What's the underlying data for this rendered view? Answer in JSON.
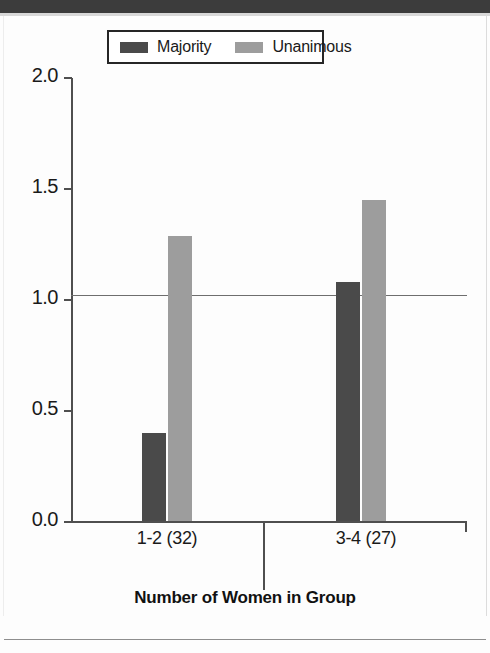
{
  "chart_data": {
    "type": "bar",
    "title": "",
    "xlabel": "Number of Women in Group",
    "ylabel": "",
    "categories": [
      "1-2 (32)",
      "3-4 (27)"
    ],
    "series": [
      {
        "name": "Majority",
        "values": [
          0.4,
          1.08
        ],
        "color": "#4a4a4a"
      },
      {
        "name": "Unanimous",
        "values": [
          1.29,
          1.45
        ],
        "color": "#9d9d9d"
      }
    ],
    "ylim": [
      0.0,
      2.0
    ],
    "yticks": [
      "0.0",
      "0.5",
      "1.0",
      "1.5",
      "2.0"
    ],
    "ytick_values": [
      0.0,
      0.5,
      1.0,
      1.5,
      2.0
    ],
    "grid": "single horizontal reference line at y = 1.0",
    "gridline_value": 1.0,
    "legend_position": "top-center",
    "legend_entries": [
      "Majority",
      "Unanimous"
    ]
  },
  "legend": {
    "entries": [
      {
        "label": "Majority",
        "swatch": "legend-swatch-majority",
        "color": "#4a4a4a"
      },
      {
        "label": "Unanimous",
        "swatch": "legend-swatch-unanimous",
        "color": "#9d9d9d"
      }
    ]
  },
  "axes": {
    "y_tick_labels": [
      "2.0",
      "1.5",
      "1.0",
      "0.5",
      "0.0"
    ],
    "x_category_labels": [
      "1-2 (32)",
      "3-4 (27)"
    ],
    "x_axis_title": "Number of Women in Group"
  },
  "colors": {
    "majority": "#4a4a4a",
    "unanimous": "#9d9d9d",
    "axis": "#4f4f4f",
    "gridline": "#6e6e6e",
    "text": "#1a1a1a",
    "scan_band": "#3c3c3c"
  }
}
